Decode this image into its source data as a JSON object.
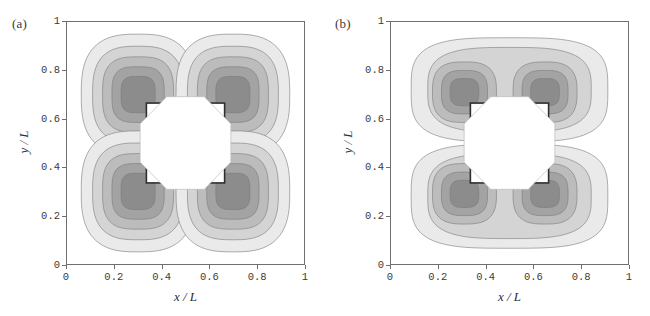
{
  "figure": {
    "background": "#ffffff",
    "frame_color": "#6f6f6f",
    "text_color": "#3a3a3a"
  },
  "chart_data": {
    "type": "heatmap",
    "title": "",
    "subtitle": "",
    "panel_count": 2,
    "xlabel": "x / L",
    "ylabel": "y / L",
    "xlim": [
      0,
      1
    ],
    "ylim": [
      0,
      1
    ],
    "xticks": [
      "0",
      "0.2",
      "0.4",
      "0.6",
      "0.8",
      "1"
    ],
    "xtickvals": [
      0,
      0.2,
      0.4,
      0.6,
      0.8,
      1
    ],
    "yticks": [
      "0",
      "0.2",
      "0.4",
      "0.6",
      "0.8",
      "1"
    ],
    "ytickvals": [
      0,
      0.2,
      0.4,
      0.6,
      0.8,
      1
    ],
    "grid": false,
    "legend": "none",
    "contour_levels": 5,
    "level_fills": [
      "#eaeaea",
      "#d4d4d4",
      "#bcbcbc",
      "#a3a3a3",
      "#8c8c8c"
    ],
    "line_color": "#7a7a7a",
    "obstacle": {
      "shape": "square-with-octagonal-core",
      "center": [
        0.5,
        0.5
      ],
      "half_width": 0.165,
      "fill": "#ffffff",
      "edge": "#2e2e2e"
    },
    "panels": [
      {
        "label": "(a)",
        "symmetry": "four-fold quadrupole",
        "lobes": 4,
        "lobe_centers": [
          [
            0.3,
            0.7
          ],
          [
            0.7,
            0.7
          ],
          [
            0.3,
            0.3
          ],
          [
            0.7,
            0.3
          ]
        ],
        "lobe_extent_x": 0.24,
        "lobe_extent_y": 0.25,
        "notes": "Four detached diagonal lobes; contours pinch to the domain mid-lines x=0.5 and y=0.5"
      },
      {
        "label": "(b)",
        "symmetry": "two-fold, top-bottom mirrored",
        "lobes": 2,
        "lobe_centers": [
          [
            0.5,
            0.72
          ],
          [
            0.5,
            0.28
          ]
        ],
        "lobe_extent_x": 0.42,
        "lobe_extent_y": 0.22,
        "core_centers": [
          [
            0.31,
            0.71
          ],
          [
            0.65,
            0.71
          ],
          [
            0.31,
            0.29
          ],
          [
            0.65,
            0.29
          ]
        ],
        "small_rings": [
          [
            0.5,
            0.655
          ],
          [
            0.5,
            0.345
          ]
        ],
        "notes": "Upper and lower bands merge across x=0.5 each enclosing two darker cores; tiny closed contour rings sit just above and below the obstacle"
      }
    ]
  },
  "panel_a": {
    "label": "(a)",
    "xlabel": "x / L",
    "ylabel": "y / L"
  },
  "panel_b": {
    "label": "(b)",
    "xlabel": "x / L",
    "ylabel": "y / L"
  }
}
